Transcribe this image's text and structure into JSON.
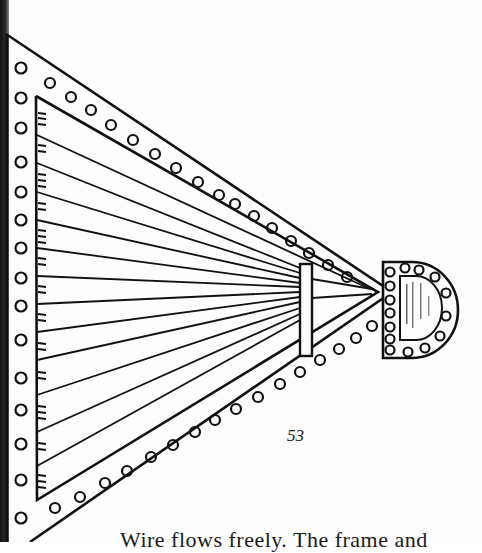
{
  "page": {
    "page_number": "53",
    "body_text_partial": "Wire flows freely. The frame and"
  },
  "figure": {
    "stroke_color": "#111111",
    "background_color": "#fdfdfd",
    "left_column_holes": 15,
    "top_band_holes": 16,
    "bottom_band_holes": 16,
    "strings": 14,
    "d_plate_holes": 16
  }
}
